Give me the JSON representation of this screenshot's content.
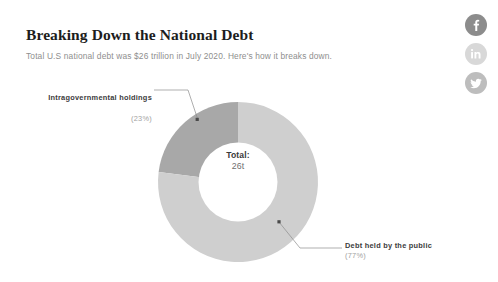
{
  "article": {
    "headline": "Breaking Down the National Debt",
    "subhead": "Total U.S national debt was $26 trillion in July 2020. Here's how it breaks down."
  },
  "social": {
    "items": [
      {
        "name": "facebook",
        "label": "f",
        "color": "#8c8c8c"
      },
      {
        "name": "linkedin",
        "label": "in",
        "color": "#d8d8d8"
      },
      {
        "name": "twitter",
        "label": "t",
        "color": "#bdbdbd"
      }
    ]
  },
  "center": {
    "total_label": "Total:",
    "total_value": "26t"
  },
  "callouts": {
    "intragovernmental": {
      "title": "Intragovernmental holdings",
      "percent": "(23%)"
    },
    "public": {
      "title": "Debt held by the public",
      "percent": "(77%)"
    }
  },
  "chart_data": {
    "type": "pie",
    "title": "Breaking Down the National Debt",
    "subtitle": "Total U.S national debt was $26 trillion in July 2020. Here's how it breaks down.",
    "variant": "donut",
    "center_text": "Total: 26t",
    "total": 26,
    "total_unit": "trillion USD",
    "legend_position": "callout-annotations",
    "grid": false,
    "slices": [
      {
        "label": "Intragovernmental holdings",
        "value": 23,
        "unit": "%",
        "color": "#a8a8a8",
        "start_angle_deg": 0,
        "end_angle_deg": -82.8
      },
      {
        "label": "Debt held by the public",
        "value": 77,
        "unit": "%",
        "color": "#cfcfcf",
        "start_angle_deg": 0,
        "end_angle_deg": 277.2
      }
    ],
    "categories": [
      "Intragovernmental holdings",
      "Debt held by the public"
    ],
    "values": [
      23,
      77
    ]
  }
}
